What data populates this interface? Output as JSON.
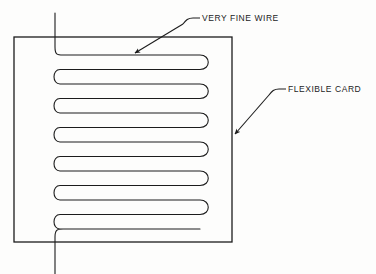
{
  "figure": {
    "background_color": "#fdfdfc",
    "line_color": "#1c1c1c"
  },
  "labels": {
    "wire": {
      "text": "VERY FINE WIRE",
      "icon": "leader-line-arrow-icon"
    },
    "card": {
      "text": "FLEXIBLE CARD",
      "icon": "leader-line-arrow-icon"
    }
  },
  "card": {
    "name": "flexible-card",
    "x": 14,
    "y": 37,
    "width": 218,
    "height": 205,
    "stroke_width": 1.3
  },
  "wire": {
    "name": "very-fine-wire",
    "stroke_width": 1.1,
    "trace_count": 13,
    "trace_spacing": 14.5,
    "first_trace_y": 55,
    "left_bend_x": 52,
    "right_bend_x": 200,
    "lead_x": 55,
    "lead_top_y": 13,
    "lead_bottom_y": 274
  },
  "leaders": {
    "wire": {
      "tick_start_x": 193,
      "tick_end_x": 200,
      "tick_y": 18,
      "arrow_x": 133,
      "arrow_y": 55
    },
    "card": {
      "tick_start_x": 279,
      "tick_end_x": 286,
      "tick_y": 89,
      "arrow_x": 233,
      "arrow_y": 136
    }
  }
}
